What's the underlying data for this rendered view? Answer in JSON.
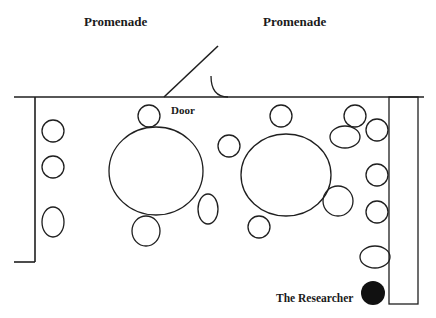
{
  "diagram": {
    "labels": {
      "promenade_left": "Promenade",
      "promenade_right": "Promenade",
      "door": "Door",
      "researcher": "The Researcher"
    },
    "colors": {
      "stroke": "#1f1f1f",
      "background": "#ffffff",
      "researcher_fill": "#111111"
    },
    "walls": {
      "top_y": 97,
      "top_x_start": 14,
      "top_x_end": 424,
      "left_x": 35,
      "left_bottom_y": 262,
      "left_tick_x_start": 14
    },
    "door": {
      "leaf": {
        "x1": 164,
        "y1": 97,
        "x2": 218,
        "y2": 46
      },
      "swing_arc": {
        "x1": 211,
        "y1": 76,
        "x2": 228,
        "y2": 97
      }
    },
    "counter": {
      "x": 389,
      "y": 97,
      "width": 29,
      "height": 207
    },
    "large_tables": [
      {
        "id": "table-left",
        "cx": 156,
        "cy": 171,
        "rx": 47,
        "ry": 44
      },
      {
        "id": "table-right",
        "cx": 286,
        "cy": 175,
        "rx": 45,
        "ry": 41
      }
    ],
    "chairs": [
      {
        "cx": 53,
        "cy": 131,
        "rx": 11,
        "ry": 11
      },
      {
        "cx": 53,
        "cy": 167,
        "rx": 11,
        "ry": 11
      },
      {
        "cx": 53,
        "cy": 222,
        "rx": 11,
        "ry": 15
      },
      {
        "cx": 149,
        "cy": 116,
        "rx": 11,
        "ry": 11
      },
      {
        "cx": 146,
        "cy": 231,
        "rx": 14,
        "ry": 15
      },
      {
        "cx": 208,
        "cy": 209,
        "rx": 10,
        "ry": 15
      },
      {
        "cx": 229,
        "cy": 146,
        "rx": 11,
        "ry": 11
      },
      {
        "cx": 281,
        "cy": 116,
        "rx": 11,
        "ry": 11
      },
      {
        "cx": 259,
        "cy": 227,
        "rx": 11,
        "ry": 11
      },
      {
        "cx": 338,
        "cy": 201,
        "rx": 15,
        "ry": 15
      },
      {
        "cx": 355,
        "cy": 116,
        "rx": 11,
        "ry": 11
      },
      {
        "cx": 345,
        "cy": 137,
        "rx": 15,
        "ry": 11
      },
      {
        "cx": 377,
        "cy": 130,
        "rx": 11,
        "ry": 11
      },
      {
        "cx": 377,
        "cy": 175,
        "rx": 11,
        "ry": 11
      },
      {
        "cx": 377,
        "cy": 212,
        "rx": 11,
        "ry": 11
      },
      {
        "cx": 375,
        "cy": 257,
        "rx": 15,
        "ry": 11
      }
    ],
    "researcher_marker": {
      "cx": 373,
      "cy": 293,
      "r": 12
    }
  }
}
